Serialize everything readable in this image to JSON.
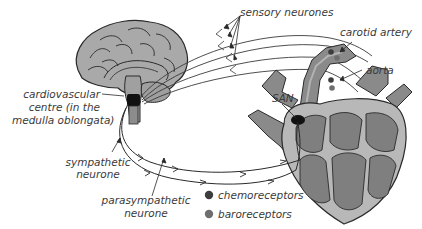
{
  "labels": {
    "sensory_neurones": "sensory neurones",
    "carotid_artery": "carotid artery",
    "aorta": "aorta",
    "san": "SAN",
    "cardiovascular_centre": [
      "cardiovascular",
      "centre (in the",
      "medulla oblongata)"
    ],
    "sympathetic_neurone": [
      "sympathetic",
      "neurone"
    ],
    "parasympathetic_neurone": [
      "parasympathetic",
      "neurone"
    ]
  },
  "legend": {
    "items": [
      {
        "label": "chemoreceptors",
        "color": "#3d3d3d"
      },
      {
        "label": "baroreceptors",
        "color": "#6e6e6e"
      }
    ]
  },
  "colors": {
    "brain_fill": "#a9a9a9",
    "heart_outer": "#b8b8b8",
    "heart_inner": "#7f7f7f",
    "vessel_fill": "#8a8a8a",
    "vessel_lumen": "#b3b3b3",
    "line": "#2a2a2a",
    "san": "#111111"
  }
}
